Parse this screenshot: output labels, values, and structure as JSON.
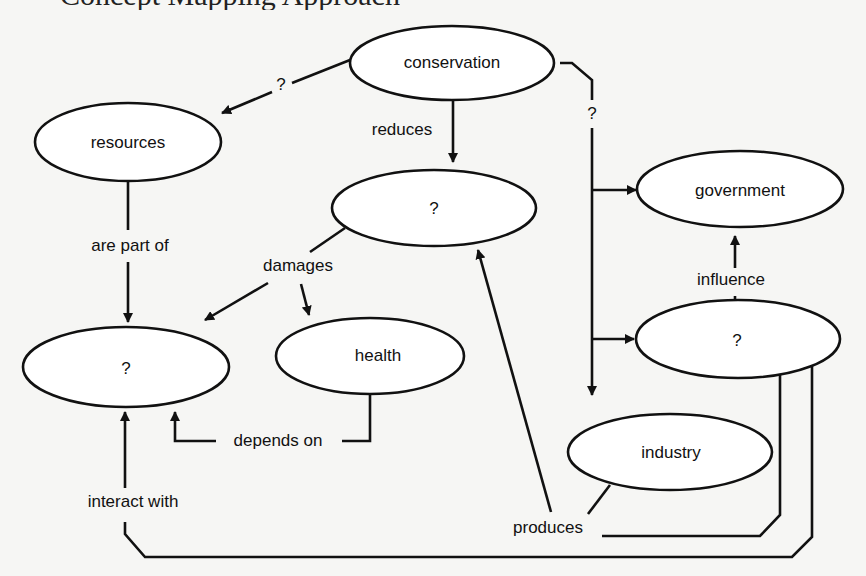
{
  "heading_fragment": "Concept Mapping Approach",
  "colors": {
    "background": "#f6f6f4",
    "stroke": "#111111",
    "node_fill": "#ffffff"
  },
  "nodes": {
    "conservation": "conservation",
    "resources": "resources",
    "unknown_top": "?",
    "government": "government",
    "unknown_left": "?",
    "health": "health",
    "unknown_right": "?",
    "industry": "industry"
  },
  "links": {
    "conservation_resources": "?",
    "conservation_reduces": "reduces",
    "conservation_right": "?",
    "are_part_of": "are part of",
    "damages": "damages",
    "influence": "influence",
    "depends_on": "depends on",
    "interact_with": "interact with",
    "produces": "produces"
  }
}
